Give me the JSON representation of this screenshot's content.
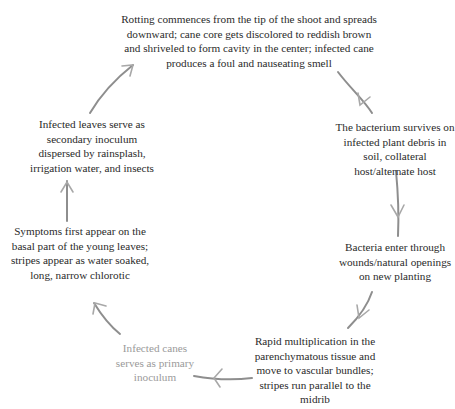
{
  "diagram": {
    "type": "cycle",
    "colors": {
      "text": "#2a2a2a",
      "faded_text": "#9a9a9a",
      "arrow": "#8e8e8e"
    },
    "nodes": [
      {
        "id": "rotting",
        "text": "Rotting commences from the tip of the shoot and spreads downward; cane core gets discolored to reddish brown and shriveled to form cavity in the center; infected cane produces a foul and nauseating smell"
      },
      {
        "id": "survival",
        "text": "The bacterium survives on infected plant debris in soil, collateral host/alternate host"
      },
      {
        "id": "entry",
        "text": "Bacteria enter through wounds/natural openings on new planting"
      },
      {
        "id": "multiplication",
        "text": "Rapid multiplication in the parenchymatous tissue and move to vascular bundles; stripes run parallel to the midrib"
      },
      {
        "id": "primary-inoculum",
        "text": "Infected canes serves as primary inoculum"
      },
      {
        "id": "symptoms",
        "text": "Symptoms first appear on the basal part of the young leaves; stripes appear as water soaked, long, narrow chlorotic"
      },
      {
        "id": "secondary-inoculum",
        "text": "Infected leaves serve as secondary inoculum dispersed by rainsplash, irrigation water, and insects"
      }
    ],
    "edges": [
      {
        "from": "rotting",
        "to": "survival"
      },
      {
        "from": "survival",
        "to": "entry"
      },
      {
        "from": "entry",
        "to": "multiplication"
      },
      {
        "from": "multiplication",
        "to": "primary-inoculum"
      },
      {
        "from": "primary-inoculum",
        "to": "symptoms"
      },
      {
        "from": "symptoms",
        "to": "secondary-inoculum"
      },
      {
        "from": "secondary-inoculum",
        "to": "rotting"
      }
    ]
  }
}
